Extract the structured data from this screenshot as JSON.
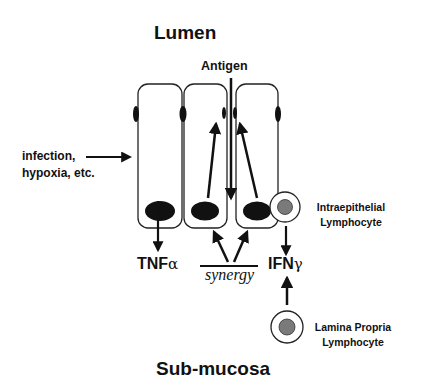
{
  "diagram": {
    "top_region_label": "Lumen",
    "bottom_region_label": "Sub-mucosa",
    "antigen_label": "Antigen",
    "stimulus_label_line1": "infection,",
    "stimulus_label_line2": "hypoxia, etc.",
    "iel_label_line1": "Intraepithelial",
    "iel_label_line2": "Lymphocyte",
    "lpl_label_line1": "Lamina Propria",
    "lpl_label_line2": "Lymphocyte",
    "tnf": {
      "base": "TNF",
      "greek": "α"
    },
    "ifn": {
      "base": "IFN",
      "greek": "γ"
    },
    "synergy_label": "synergy",
    "colors": {
      "ink": "#111111",
      "lymphocyte_nucleus": "#7a7a7a",
      "background": "#ffffff"
    },
    "cells": [
      {
        "id": "epithelial-cell-1",
        "nucleus": "basal"
      },
      {
        "id": "epithelial-cell-2",
        "nucleus": "basal"
      },
      {
        "id": "epithelial-cell-3",
        "nucleus": "basal"
      }
    ]
  }
}
